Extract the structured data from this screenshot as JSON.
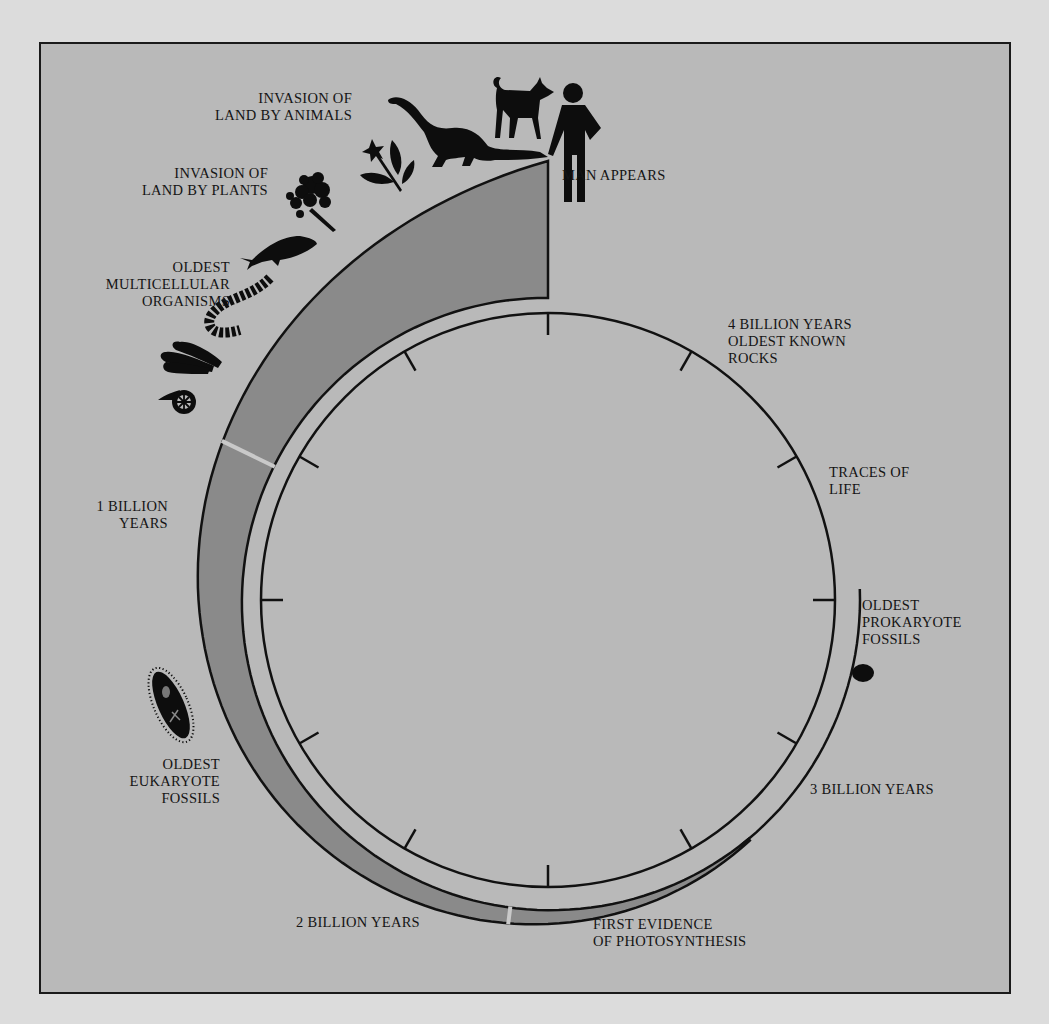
{
  "diagram": {
    "colors": {
      "page_background": "#dcdcdc",
      "panel_background": "#b9b9b9",
      "spiral_band": "#8a8a8a",
      "inner_ring": "#c4c4c4",
      "ink": "#141414"
    },
    "time_markers": [
      {
        "id": "4by",
        "label": "4 BILLION YEARS\nOLDEST KNOWN\nROCKS"
      },
      {
        "id": "3by",
        "label": "3 BILLION YEARS"
      },
      {
        "id": "2by",
        "label": "2 BILLION YEARS"
      },
      {
        "id": "1by",
        "label": "1 BILLION\nYEARS"
      }
    ],
    "events": [
      {
        "id": "man",
        "label": "MAN APPEARS",
        "icon": "human-figure-icon"
      },
      {
        "id": "land_animals",
        "label": "INVASION OF\nLAND BY ANIMALS",
        "icon": "dinosaur-icon"
      },
      {
        "id": "land_plants",
        "label": "INVASION OF\nLAND BY PLANTS",
        "icon": "tree-icon"
      },
      {
        "id": "multicellular",
        "label": "OLDEST\nMULTICELLULAR\nORGANISMS",
        "icon": "worm-icon"
      },
      {
        "id": "eukaryote",
        "label": "OLDEST\nEUKARYOTE\nFOSSILS",
        "icon": "ciliate-icon"
      },
      {
        "id": "photosynthesis",
        "label": "FIRST EVIDENCE\nOF PHOTOSYNTHESIS",
        "icon": null
      },
      {
        "id": "prokaryote",
        "label": "OLDEST\nPROKARYOTE\nFOSSILS",
        "icon": "cell-dot-icon"
      },
      {
        "id": "traces",
        "label": "TRACES OF\nLIFE",
        "icon": null
      }
    ],
    "icons": [
      "flower-icon",
      "dog-icon",
      "dinosaur-icon",
      "human-figure-icon",
      "tree-icon",
      "fish-icon",
      "worm-icon",
      "algae-icon",
      "shell-icon",
      "ciliate-icon",
      "cell-dot-icon"
    ],
    "clock_ticks": 12
  }
}
